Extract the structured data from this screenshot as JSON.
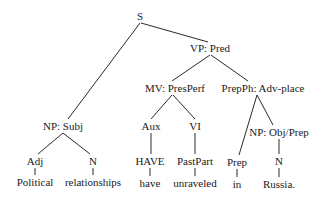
{
  "tree": {
    "nodes": {
      "s": {
        "label": "S",
        "x": 140,
        "y": 16
      },
      "vp": {
        "label": "VP: Pred",
        "x": 210,
        "y": 48
      },
      "np_subj": {
        "label": "NP: Subj",
        "x": 63,
        "y": 126
      },
      "mv": {
        "label": "MV: PresPerf",
        "x": 175,
        "y": 88
      },
      "prepph": {
        "label": "PrepPh: Adv-place",
        "x": 263,
        "y": 88
      },
      "adj": {
        "label": "Adj",
        "x": 35,
        "y": 161
      },
      "n1": {
        "label": "N",
        "x": 93,
        "y": 161
      },
      "political": {
        "label": "Political",
        "x": 35,
        "y": 182
      },
      "relationships": {
        "label": "relationships",
        "x": 93,
        "y": 182
      },
      "aux": {
        "label": "Aux",
        "x": 151,
        "y": 126
      },
      "vi": {
        "label": "VI",
        "x": 195,
        "y": 126
      },
      "have_cap": {
        "label": "HAVE",
        "x": 150,
        "y": 161
      },
      "pastpart": {
        "label": "PastPart",
        "x": 195,
        "y": 161
      },
      "have": {
        "label": "have",
        "x": 150,
        "y": 183
      },
      "unraveled": {
        "label": "unraveled",
        "x": 195,
        "y": 183
      },
      "np_obj": {
        "label": "NP: Obj/Prep",
        "x": 279,
        "y": 132
      },
      "prep": {
        "label": "Prep",
        "x": 237,
        "y": 162
      },
      "n2": {
        "label": "N",
        "x": 279,
        "y": 161
      },
      "in": {
        "label": "in",
        "x": 237,
        "y": 184
      },
      "russia": {
        "label": "Russia.",
        "x": 279,
        "y": 184
      }
    },
    "edges": [
      [
        140,
        23,
        68,
        119
      ],
      [
        141,
        23,
        208,
        42
      ],
      [
        210,
        55,
        172,
        81
      ],
      [
        211,
        55,
        248,
        81
      ],
      [
        172,
        95,
        151,
        119
      ],
      [
        173,
        95,
        195,
        119
      ],
      [
        257,
        95,
        239,
        155
      ],
      [
        257,
        95,
        273,
        125
      ],
      [
        63,
        133,
        38,
        154
      ],
      [
        63,
        133,
        90,
        154
      ],
      [
        151,
        133,
        151,
        154
      ],
      [
        195,
        133,
        195,
        154
      ],
      [
        279,
        139,
        279,
        154
      ],
      [
        35,
        168,
        35,
        175
      ],
      [
        93,
        168,
        93,
        175
      ],
      [
        150,
        168,
        150,
        176
      ],
      [
        195,
        168,
        195,
        176
      ],
      [
        237,
        169,
        237,
        177
      ],
      [
        279,
        168,
        279,
        177
      ]
    ]
  }
}
